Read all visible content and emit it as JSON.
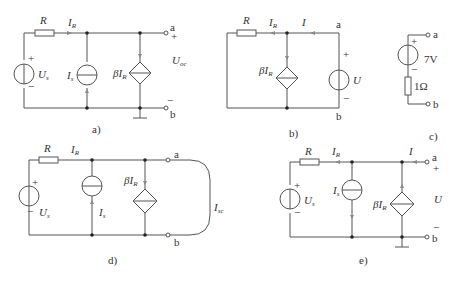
{
  "figures": [
    {
      "id": "a",
      "caption": "a)",
      "labels": {
        "R": "R",
        "IR": "I",
        "IR_sub": "R",
        "Us": "U",
        "Us_sub": "s",
        "Is": "I",
        "Is_sub": "s",
        "dep": "βI",
        "dep_sub": "R",
        "Uoc": "U",
        "Uoc_sub": "oc",
        "a": "a",
        "b": "b",
        "plus": "+",
        "minus": "−"
      }
    },
    {
      "id": "b",
      "caption": "b)",
      "labels": {
        "R": "R",
        "IR": "I",
        "IR_sub": "R",
        "I": "I",
        "dep": "βI",
        "dep_sub": "R",
        "U": "U",
        "a": "a",
        "b": "b",
        "plus": "+",
        "minus": "−"
      }
    },
    {
      "id": "c",
      "caption": "c)",
      "labels": {
        "V": "7V",
        "Res": "1Ω",
        "a": "a",
        "b": "b",
        "plus": "+",
        "minus": "−"
      }
    },
    {
      "id": "d",
      "caption": "d)",
      "labels": {
        "R": "R",
        "IR": "I",
        "IR_sub": "R",
        "Us": "U",
        "Us_sub": "s",
        "Is": "I",
        "Is_sub": "s",
        "dep": "βI",
        "dep_sub": "R",
        "Isc": "I",
        "Isc_sub": "sc",
        "a": "a",
        "b": "b",
        "plus": "+",
        "minus": "−"
      }
    },
    {
      "id": "e",
      "caption": "e)",
      "labels": {
        "R": "R",
        "IR": "I",
        "IR_sub": "R",
        "I": "I",
        "Us": "U",
        "Us_sub": "s",
        "Is": "I",
        "Is_sub": "s",
        "dep": "βI",
        "dep_sub": "R",
        "U": "U",
        "a": "a",
        "b": "b",
        "plus": "+",
        "minus": "−"
      }
    }
  ]
}
